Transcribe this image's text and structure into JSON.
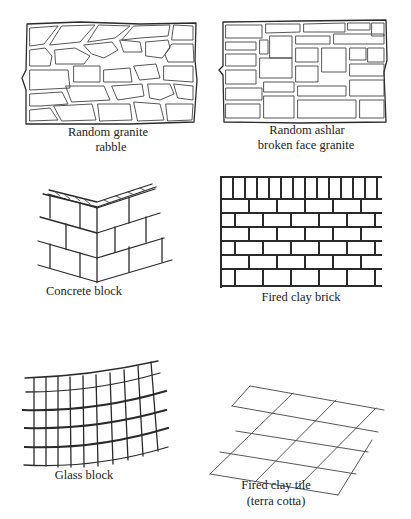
{
  "figure": {
    "panels": [
      {
        "id": "random-granite-rubble",
        "label_lines": [
          "Random granite",
          "rabble"
        ]
      },
      {
        "id": "random-ashlar",
        "label_lines": [
          "Random ashlar",
          "broken face granite"
        ]
      },
      {
        "id": "concrete-block",
        "label_lines": [
          "Concrete block"
        ]
      },
      {
        "id": "fired-clay-brick",
        "label_lines": [
          "Fired clay brick"
        ]
      },
      {
        "id": "glass-block",
        "label_lines": [
          "Glass block"
        ]
      },
      {
        "id": "fired-clay-tile",
        "label_lines": [
          "Fired clay tile",
          "(terra cotta)"
        ]
      }
    ],
    "colors": {
      "line": "#2a2a2a",
      "background": "#ffffff",
      "text": "#222222"
    }
  }
}
